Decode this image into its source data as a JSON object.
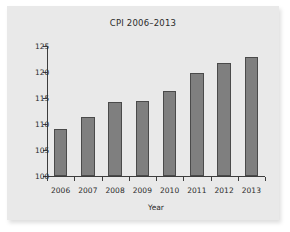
{
  "figure": {
    "background_color": "#e9e9e9",
    "page_color": "#ffffff",
    "bar_fill_color": "#7f7f7f",
    "bar_edge_color": "#4a4a4a",
    "axis_color": "#3d3d3d",
    "text_color": "#2b2b2b"
  },
  "chart_data": {
    "type": "bar",
    "title": "CPI 2006–2013",
    "xlabel": "Year",
    "ylabel": "",
    "categories": [
      "2006",
      "2007",
      "2008",
      "2009",
      "2010",
      "2011",
      "2012",
      "2013"
    ],
    "values": [
      109.0,
      111.4,
      114.2,
      114.4,
      116.3,
      119.9,
      121.7,
      122.9
    ],
    "series": [
      {
        "name": "CPI",
        "values": [
          109.0,
          111.4,
          114.2,
          114.4,
          116.3,
          119.9,
          121.7,
          122.9
        ]
      }
    ],
    "ylim": [
      100,
      125
    ],
    "yticks": [
      100,
      105,
      110,
      115,
      120,
      125
    ],
    "ytick_labels": [
      "100",
      "105",
      "110",
      "115",
      "120",
      "125"
    ],
    "xtick_labels": [
      "2006",
      "2007",
      "2008",
      "2009",
      "2010",
      "2011",
      "2012",
      "2013"
    ],
    "grid": false,
    "legend": false,
    "legend_position": "none",
    "annotations": []
  }
}
